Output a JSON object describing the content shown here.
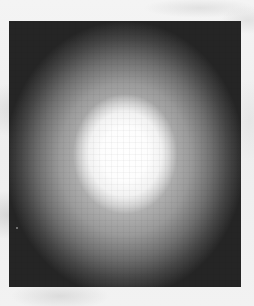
{
  "image": {
    "description": "Grayscale rectangle with bright radial glow centered on a dark field, on a light mottled background",
    "colors": {
      "background": "#f1f1f1",
      "frame_dark": "#202020",
      "glow_center": "#ffffff",
      "glow_mid": "#9a9a9a"
    }
  }
}
